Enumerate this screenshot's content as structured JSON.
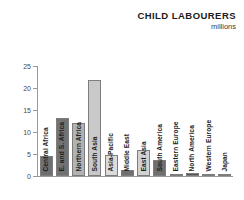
{
  "header": {
    "title": "CHILD LABOURERS",
    "subtitle": "millions"
  },
  "chart_data": {
    "type": "bar",
    "title": "CHILD LABOURERS",
    "subtitle": "millions",
    "xlabel": "",
    "ylabel": "millions",
    "ylim": [
      0,
      25
    ],
    "yticks": [
      0,
      5,
      10,
      15,
      20,
      25
    ],
    "grid": false,
    "legend": "none",
    "categories": [
      "Central Africa",
      "E. and S. Africa",
      "Northern Africa",
      "South Asia",
      "Asia-Pacific",
      "Middle East",
      "East Asia",
      "South America",
      "Eastern Europe",
      "North America",
      "Western Europe",
      "Japan"
    ],
    "values": [
      4.5,
      13.2,
      12.0,
      21.8,
      4.8,
      1.3,
      5.9,
      3.7,
      0.4,
      0.7,
      0.1,
      0.05
    ],
    "bar_colors": [
      "#6f6f6f",
      "#727272",
      "#b2b2b2",
      "#c9c9c9",
      "#dcdcdc",
      "#6f6f6f",
      "#d2d2d2",
      "#6f6f6f",
      "#8a8a8a",
      "#555555",
      "#b8b8b8",
      "#b8b8b8"
    ]
  },
  "colors": {
    "axis": "#9a9a9a",
    "text": "#1d1d1d",
    "background": "#ffffff"
  }
}
